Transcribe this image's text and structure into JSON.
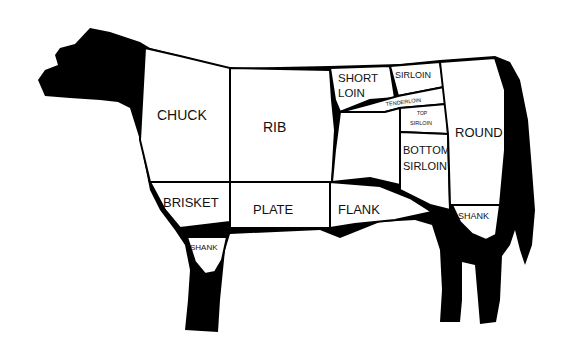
{
  "diagram": {
    "colors": {
      "silhouette": "#000000",
      "cut_fill": "#ffffff",
      "text": "#111111"
    },
    "cuts": [
      {
        "id": "chuck",
        "label": "CHUCK"
      },
      {
        "id": "rib",
        "label": "RIB"
      },
      {
        "id": "short-loin",
        "label_line1": "SHORT",
        "label_line2": "LOIN"
      },
      {
        "id": "sirloin",
        "label": "SIRLOIN"
      },
      {
        "id": "tenderloin",
        "label": "TENDERLOIN"
      },
      {
        "id": "top-sirloin",
        "label_line1": "TOP",
        "label_line2": "SIRLOIN"
      },
      {
        "id": "bottom-sirloin",
        "label_line1": "BOTTOM",
        "label_line2": "SIRLOIN"
      },
      {
        "id": "round",
        "label": "ROUND"
      },
      {
        "id": "brisket",
        "label": "BRISKET"
      },
      {
        "id": "plate",
        "label": "PLATE"
      },
      {
        "id": "flank",
        "label": "FLANK"
      },
      {
        "id": "fore-shank",
        "label": "SHANK"
      },
      {
        "id": "hind-shank",
        "label": "SHANK"
      }
    ]
  }
}
